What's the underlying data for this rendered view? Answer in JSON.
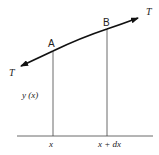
{
  "diagram": {
    "colors": {
      "line": "#333333",
      "curve": "#111111",
      "text": "#222222",
      "background": "#ffffff"
    },
    "points": {
      "A": {
        "label": "A"
      },
      "B": {
        "label": "B"
      }
    },
    "tension": {
      "left_label": "T",
      "right_label": "T"
    },
    "displacement_label": "y (x)",
    "axis": {
      "x_label": "x",
      "x_plus_dx_label": "x + dx"
    }
  }
}
